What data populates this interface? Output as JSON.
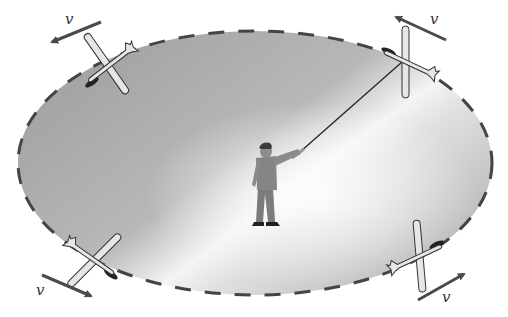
{
  "figure": {
    "velocity_label": "v",
    "colors": {
      "background": "#ffffff",
      "field_gray": "#a9a9a9",
      "field_highlight": "#ffffff",
      "dash": "#444444",
      "plane_fill": "#e6e6e6",
      "plane_stroke": "#333333",
      "arrow": "#4a4a4a",
      "person": "#808080"
    },
    "labels": [
      {
        "id": "v-top-left",
        "text": "v"
      },
      {
        "id": "v-top-right",
        "text": "v"
      },
      {
        "id": "v-bottom-left",
        "text": "v"
      },
      {
        "id": "v-bottom-right",
        "text": "v"
      }
    ]
  }
}
